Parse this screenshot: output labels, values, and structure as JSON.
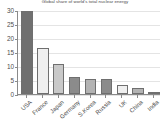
{
  "chart_data": {
    "type": "bar",
    "title": "Global share of world's total nuclear energy",
    "xlabel": "",
    "ylabel": "",
    "ylim": [
      0,
      30
    ],
    "yticks": [
      0,
      5,
      10,
      15,
      20,
      25,
      30
    ],
    "ytick_labels": [
      "0",
      "5",
      "10",
      "15",
      "20",
      "25",
      "30"
    ],
    "grid": true,
    "legend": "none",
    "categories": [
      "USA",
      "France",
      "Japan",
      "Germany",
      "S.Korea",
      "Russia",
      "UK",
      "China",
      "India"
    ],
    "values": [
      29.8,
      16.3,
      10.7,
      6.0,
      5.3,
      5.4,
      3.1,
      2.0,
      0.7
    ],
    "bar_colors": [
      "#707070",
      "#efefef",
      "#c9c9c9",
      "#8b8b8b",
      "#b3b3b3",
      "#8b8b8b",
      "#efefef",
      "#b3b3b3",
      "#8b8b8b"
    ],
    "bar_edge_color": "#6f6f6f",
    "axis_color": "#8a8a8a",
    "grid_color": "#e4e4e4",
    "background": "#ffffff",
    "text_color": "#4d4d4d"
  }
}
